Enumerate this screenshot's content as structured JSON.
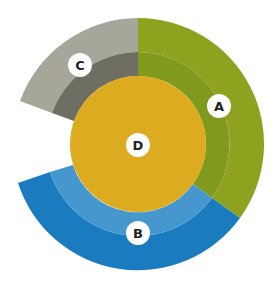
{
  "diagram": {
    "type": "concentric-ring-segments",
    "center": {
      "label": "D",
      "color": "#dcab20"
    },
    "segments": [
      {
        "label": "A",
        "outer_color": "#8ea21f",
        "inner_color": "#7f9a1c"
      },
      {
        "label": "B",
        "outer_color": "#1a7cbf",
        "inner_color": "#4797cf"
      },
      {
        "label": "C",
        "outer_color": "#a6a69b",
        "inner_color": "#6f6e62"
      }
    ]
  }
}
